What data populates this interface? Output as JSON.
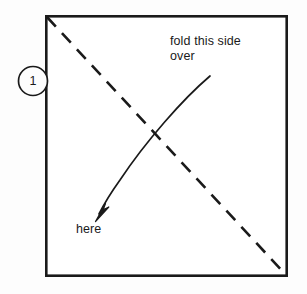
{
  "diagram": {
    "step_badge": {
      "number": "1"
    },
    "labels": {
      "fold_instruction": "fold this side\nover",
      "target_point": "here"
    },
    "colors": {
      "stroke": "#1a1a1a",
      "background": "#fdfdfd",
      "paper_fill": "#ffffff"
    },
    "geometry": {
      "paper_square": {
        "x": 45,
        "y": 15,
        "width": 243,
        "height": 262,
        "stroke_width": 2.6
      },
      "fold_line": {
        "type": "dashed-diagonal",
        "from": [
          47,
          17
        ],
        "to": [
          286,
          275
        ],
        "dash": "13 9",
        "stroke_width": 2.6
      },
      "fold_arrow": {
        "type": "curved-arrow",
        "start": [
          210,
          76
        ],
        "end": [
          97,
          218
        ],
        "stroke_width": 1.6
      },
      "step_circle": {
        "cx": 33,
        "cy": 81,
        "r": 14.5,
        "stroke_width": 1.6
      }
    }
  }
}
